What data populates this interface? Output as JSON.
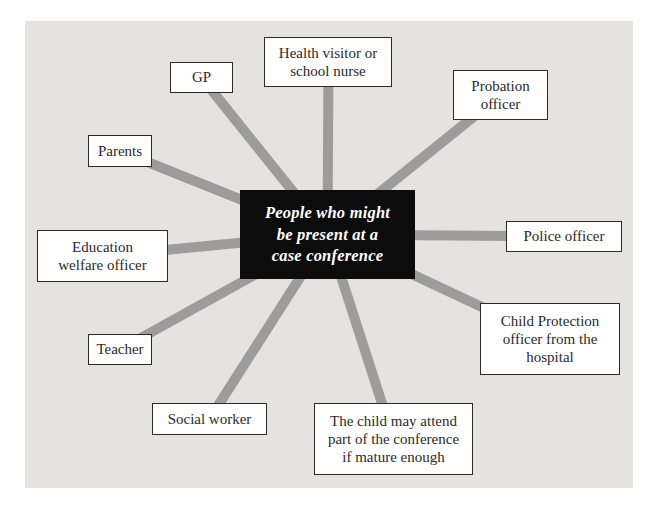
{
  "diagram": {
    "title": "People who might be present at a case conference",
    "center": {
      "label": "People who might\nbe present at a\ncase conference"
    },
    "nodes": [
      {
        "id": "gp",
        "label": "GP"
      },
      {
        "id": "health-visitor",
        "label": "Health visitor or\nschool nurse"
      },
      {
        "id": "probation-officer",
        "label": "Probation\nofficer"
      },
      {
        "id": "parents",
        "label": "Parents"
      },
      {
        "id": "police-officer",
        "label": "Police officer"
      },
      {
        "id": "education-welfare",
        "label": "Education\nwelfare officer"
      },
      {
        "id": "child-protection",
        "label": "Child Protection\nofficer from the\nhospital"
      },
      {
        "id": "teacher",
        "label": "Teacher"
      },
      {
        "id": "social-worker",
        "label": "Social worker"
      },
      {
        "id": "child-may-attend",
        "label": "The child may attend\npart of the conference\nif mature enough"
      }
    ]
  },
  "colors": {
    "page_background": "#ffffff",
    "panel_background": "#e4e3e1",
    "connector": "#9c9c9c",
    "node_background": "#fefefe",
    "node_border": "#2b2b2b",
    "node_text": "#2b2b2b",
    "center_background": "#0c0c0c",
    "center_text": "#ffffff"
  }
}
